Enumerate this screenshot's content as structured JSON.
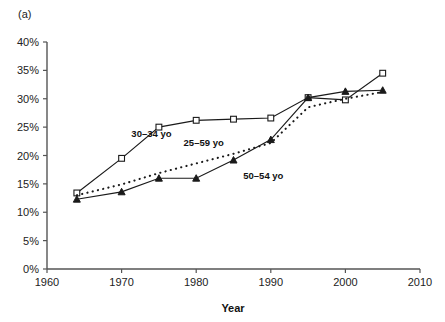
{
  "panel": {
    "label": "(a)"
  },
  "chart_data": {
    "type": "line",
    "title": "",
    "subtitle": "",
    "xlabel": "Year",
    "ylabel": "",
    "xlim": [
      1960,
      2010
    ],
    "ylim": [
      0,
      40
    ],
    "grid": false,
    "legend_position": "inline-annotations",
    "x_ticks": [
      "1960",
      "1970",
      "1980",
      "1990",
      "2000",
      "2010"
    ],
    "x_tick_values": [
      1960,
      1970,
      1980,
      1990,
      2000,
      2010
    ],
    "y_ticks": [
      "0%",
      "5%",
      "10%",
      "15%",
      "20%",
      "25%",
      "30%",
      "35%",
      "40%"
    ],
    "y_tick_values": [
      0,
      5,
      10,
      15,
      20,
      25,
      30,
      35,
      40
    ],
    "series": [
      {
        "name": "30–34 yo",
        "marker": "open-square",
        "style": "solid",
        "label_x": 1974,
        "label_y": 23.2,
        "x": [
          1964,
          1970,
          1975,
          1980,
          1985,
          1990,
          1995,
          2000,
          2005
        ],
        "values": [
          13.4,
          19.5,
          25.0,
          26.2,
          26.4,
          26.6,
          30.2,
          29.8,
          34.5
        ]
      },
      {
        "name": "25–59 yo",
        "marker": "none",
        "style": "dotted",
        "label_x": 1981,
        "label_y": 21.6,
        "x": [
          1964,
          1970,
          1975,
          1980,
          1985,
          1990,
          1995,
          2000,
          2005
        ],
        "values": [
          13.0,
          14.9,
          16.9,
          18.6,
          20.3,
          22.2,
          28.5,
          30.0,
          31.2
        ]
      },
      {
        "name": "50–54 yo",
        "marker": "filled-triangle",
        "style": "solid",
        "label_x": 1989,
        "label_y": 15.8,
        "x": [
          1964,
          1970,
          1975,
          1980,
          1985,
          1990,
          1995,
          2000,
          2005
        ],
        "values": [
          12.3,
          13.6,
          16.0,
          16.0,
          19.2,
          22.8,
          30.2,
          31.3,
          31.5
        ]
      }
    ]
  }
}
